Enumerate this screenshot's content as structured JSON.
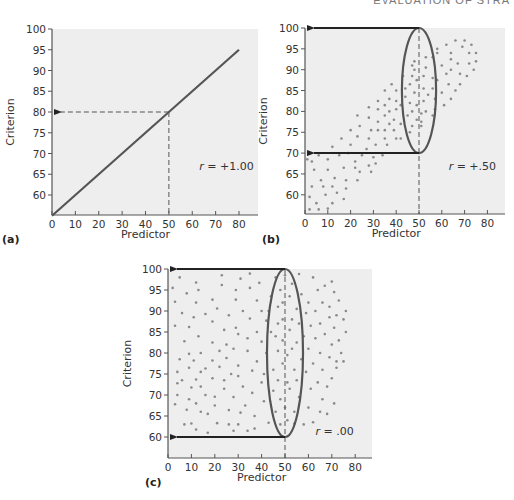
{
  "header": {
    "running_head": "EVALUATION OF STRA"
  },
  "colors": {
    "plot_bg": "#eeeeee",
    "axis": "#555555",
    "point": "#8a8a8a",
    "line": "#555555",
    "arrow": "#222222",
    "ellipse": "#555555"
  },
  "chart_data": [
    {
      "id": "a",
      "type": "line",
      "panel_label": "(a)",
      "title": "",
      "xlabel": "Predictor",
      "ylabel": "Criterion",
      "xlim": [
        0,
        88
      ],
      "ylim": [
        55,
        100
      ],
      "xticks": [
        0,
        10,
        20,
        30,
        40,
        50,
        60,
        70,
        80
      ],
      "yticks": [
        60,
        65,
        70,
        75,
        80,
        85,
        90,
        95,
        100
      ],
      "grid": false,
      "annotation": {
        "text": "r = +1.00",
        "r_symbol": "r",
        "r_value": " = +1.00",
        "x": 63,
        "y": 66
      },
      "series": [
        {
          "name": "perfect correlation",
          "x": [
            0,
            80
          ],
          "y": [
            55,
            95
          ]
        }
      ],
      "guide": {
        "x": 50,
        "y": 80,
        "style": "dashed",
        "arrow_to": "y-axis"
      }
    },
    {
      "id": "b",
      "type": "scatter",
      "panel_label": "(b)",
      "title": "",
      "xlabel": "Predictor",
      "ylabel": "Criterion",
      "xlim": [
        0,
        88
      ],
      "ylim": [
        55,
        100
      ],
      "xticks": [
        0,
        10,
        20,
        30,
        40,
        50,
        60,
        70,
        80
      ],
      "yticks": [
        60,
        65,
        70,
        75,
        80,
        85,
        90,
        95,
        100
      ],
      "grid": false,
      "annotation": {
        "text": "r = +.50",
        "r_symbol": "r",
        "r_value": " = +.50",
        "x": 63,
        "y": 66
      },
      "ellipse": {
        "cx": 50,
        "cy": 85,
        "rx": 7.5,
        "ry": 15
      },
      "arrows": [
        {
          "from_x": 50,
          "y": 100
        },
        {
          "from_x": 50,
          "y": 70
        }
      ],
      "guide": {
        "x": 50,
        "style": "dashed"
      },
      "points": [
        [
          1,
          68.5
        ],
        [
          3,
          68
        ],
        [
          6,
          69.5
        ],
        [
          2,
          59.5
        ],
        [
          3,
          62
        ],
        [
          4,
          66
        ],
        [
          5,
          58
        ],
        [
          7,
          63.5
        ],
        [
          8,
          62
        ],
        [
          2,
          56.5
        ],
        [
          6,
          56.5
        ],
        [
          10,
          56.7
        ],
        [
          9,
          60
        ],
        [
          10,
          66
        ],
        [
          10,
          68.5
        ],
        [
          12,
          62
        ],
        [
          12,
          58
        ],
        [
          13,
          64
        ],
        [
          14,
          60.5
        ],
        [
          12,
          71.5
        ],
        [
          15,
          69.5
        ],
        [
          17,
          59
        ],
        [
          18,
          63.5
        ],
        [
          18,
          61.5
        ],
        [
          17,
          66.5
        ],
        [
          19,
          70
        ],
        [
          20,
          72
        ],
        [
          20,
          75.5
        ],
        [
          16,
          73.5
        ],
        [
          22,
          66.5
        ],
        [
          23,
          63.5
        ],
        [
          22,
          68
        ],
        [
          24,
          65.5
        ],
        [
          25,
          69.5
        ],
        [
          23,
          74
        ],
        [
          24,
          76.5
        ],
        [
          23,
          79
        ],
        [
          27,
          71
        ],
        [
          28,
          67
        ],
        [
          28,
          73.5
        ],
        [
          29,
          65.5
        ],
        [
          29,
          75.5
        ],
        [
          28,
          78.5
        ],
        [
          28,
          81
        ],
        [
          30,
          69
        ],
        [
          31,
          72
        ],
        [
          31,
          67.5
        ],
        [
          32,
          75.5
        ],
        [
          32,
          77.5
        ],
        [
          32,
          80.5
        ],
        [
          32,
          82.5
        ],
        [
          34,
          69.5
        ],
        [
          35,
          73.5
        ],
        [
          35,
          75.5
        ],
        [
          35,
          79
        ],
        [
          35,
          81.5
        ],
        [
          35,
          85
        ],
        [
          36,
          72
        ],
        [
          37,
          77
        ],
        [
          37,
          83
        ],
        [
          37,
          80
        ],
        [
          39,
          75.5
        ],
        [
          39,
          78
        ],
        [
          40,
          73.5
        ],
        [
          40,
          82.5
        ],
        [
          40,
          85
        ],
        [
          40,
          80.5
        ],
        [
          38,
          86.5
        ],
        [
          42,
          73.5
        ],
        [
          42,
          77
        ],
        [
          42,
          81.5
        ],
        [
          43,
          88.5
        ],
        [
          44,
          83.5
        ],
        [
          44,
          85.5
        ],
        [
          45,
          79
        ],
        [
          46,
          75
        ],
        [
          46,
          86.5
        ],
        [
          46,
          82
        ],
        [
          47,
          88.5
        ],
        [
          47,
          91
        ],
        [
          47,
          80
        ],
        [
          47,
          76.5
        ],
        [
          48,
          84.5
        ],
        [
          48,
          92
        ],
        [
          48,
          90
        ],
        [
          49,
          78
        ],
        [
          49,
          81.5
        ],
        [
          49,
          87.5
        ],
        [
          51,
          76.5
        ],
        [
          51,
          77.5
        ],
        [
          51,
          79.5
        ],
        [
          52,
          82.5
        ],
        [
          52,
          85.5
        ],
        [
          52,
          88.5
        ],
        [
          53,
          90.5
        ],
        [
          53,
          80
        ],
        [
          53,
          93
        ],
        [
          54,
          84
        ],
        [
          56,
          79
        ],
        [
          56,
          85.5
        ],
        [
          56,
          88
        ],
        [
          56,
          93
        ],
        [
          57,
          80.5
        ],
        [
          57,
          83
        ],
        [
          58,
          94
        ],
        [
          58,
          95
        ],
        [
          58,
          87.5
        ],
        [
          60,
          91
        ],
        [
          60,
          84.5
        ],
        [
          61,
          81.5
        ],
        [
          62,
          96
        ],
        [
          62,
          89
        ],
        [
          63,
          86.5
        ],
        [
          64,
          92.5
        ],
        [
          64,
          83
        ],
        [
          64,
          90
        ],
        [
          64,
          94
        ],
        [
          66,
          97
        ],
        [
          66,
          85
        ],
        [
          67,
          91.5
        ],
        [
          68,
          86.5
        ],
        [
          68,
          89
        ],
        [
          69,
          95.5
        ],
        [
          70,
          97
        ],
        [
          71,
          88.5
        ],
        [
          72,
          91.5
        ],
        [
          72,
          94
        ],
        [
          73,
          96
        ],
        [
          74,
          90
        ],
        [
          75,
          92
        ],
        [
          75,
          94
        ]
      ]
    },
    {
      "id": "c",
      "type": "scatter",
      "panel_label": "(c)",
      "title": "",
      "xlabel": "Predictor",
      "ylabel": "Criterion",
      "xlim": [
        0,
        88
      ],
      "ylim": [
        55,
        100
      ],
      "xticks": [
        0,
        10,
        20,
        30,
        40,
        50,
        60,
        70,
        80
      ],
      "yticks": [
        60,
        65,
        70,
        75,
        80,
        85,
        90,
        95,
        100
      ],
      "grid": false,
      "annotation": {
        "text": "r = .00",
        "r_symbol": "r",
        "r_value": " = .00",
        "x": 63,
        "y": 60.5
      },
      "ellipse": {
        "cx": 50,
        "cy": 80,
        "rx": 7.7,
        "ry": 20
      },
      "arrows": [
        {
          "from_x": 50,
          "y": 100
        },
        {
          "from_x": 50,
          "y": 60
        }
      ],
      "guide": {
        "x": 50,
        "style": "dashed"
      },
      "points": [
        [
          2,
          95.5
        ],
        [
          3,
          92.2
        ],
        [
          3,
          86.5
        ],
        [
          5,
          98
        ],
        [
          6,
          89.5
        ],
        [
          7,
          82.8
        ],
        [
          8,
          94.2
        ],
        [
          9,
          86.2
        ],
        [
          9,
          79.8
        ],
        [
          9,
          76.5
        ],
        [
          5,
          78.5
        ],
        [
          4,
          75.5
        ],
        [
          4,
          72.8
        ],
        [
          4,
          70
        ],
        [
          3,
          67.8
        ],
        [
          6,
          73.5
        ],
        [
          8,
          66.5
        ],
        [
          7,
          63
        ],
        [
          9,
          69
        ],
        [
          10,
          71.8
        ],
        [
          10,
          63.2
        ],
        [
          12,
          61.8
        ],
        [
          12,
          68
        ],
        [
          12,
          73.7
        ],
        [
          11,
          78.2
        ],
        [
          11,
          88.5
        ],
        [
          12,
          92
        ],
        [
          12,
          96.8
        ],
        [
          13,
          95
        ],
        [
          13,
          84
        ],
        [
          14,
          80
        ],
        [
          14,
          75.5
        ],
        [
          14,
          72
        ],
        [
          14,
          66
        ],
        [
          16,
          89.3
        ],
        [
          16,
          76.3
        ],
        [
          16,
          70
        ],
        [
          17,
          61
        ],
        [
          17,
          65.5
        ],
        [
          19,
          92.7
        ],
        [
          19,
          87.5
        ],
        [
          19,
          82.5
        ],
        [
          19,
          78.2
        ],
        [
          19,
          74
        ],
        [
          20,
          69.6
        ],
        [
          20,
          67.5
        ],
        [
          21,
          63.3
        ],
        [
          21,
          90.6
        ],
        [
          22,
          80.5
        ],
        [
          22,
          76.7
        ],
        [
          23,
          96.2
        ],
        [
          23,
          98.5
        ],
        [
          24,
          71.5
        ],
        [
          24,
          73.5
        ],
        [
          24,
          85.5
        ],
        [
          25,
          82
        ],
        [
          25,
          78.8
        ],
        [
          26,
          66.4
        ],
        [
          26,
          89
        ],
        [
          26,
          63
        ],
        [
          27,
          75
        ],
        [
          28,
          69.5
        ],
        [
          28,
          61.5
        ],
        [
          28,
          81
        ],
        [
          29,
          86
        ],
        [
          29,
          92.7
        ],
        [
          29,
          95
        ],
        [
          30,
          77
        ],
        [
          30,
          74.5
        ],
        [
          30,
          84.5
        ],
        [
          30,
          63
        ],
        [
          31,
          65.8
        ],
        [
          31,
          97.7
        ],
        [
          32,
          90
        ],
        [
          32,
          72
        ],
        [
          33,
          67.5
        ],
        [
          34,
          61.5
        ],
        [
          34,
          80.5
        ],
        [
          34,
          83.5
        ],
        [
          35,
          88.2
        ],
        [
          35,
          95.5
        ],
        [
          35,
          98.9
        ],
        [
          36,
          75.8
        ],
        [
          36,
          70.5
        ],
        [
          37,
          65
        ],
        [
          37,
          62
        ],
        [
          38,
          92.5
        ],
        [
          38,
          85
        ],
        [
          38,
          78
        ],
        [
          39,
          96.7
        ],
        [
          40,
          90
        ],
        [
          40,
          82.7
        ],
        [
          40,
          73
        ],
        [
          41,
          68.5
        ],
        [
          41,
          75
        ],
        [
          42,
          87.7
        ],
        [
          42,
          80
        ],
        [
          43,
          63.4
        ],
        [
          43,
          90
        ],
        [
          44,
          85
        ],
        [
          44,
          93.5
        ],
        [
          45,
          71
        ],
        [
          45,
          76
        ],
        [
          46,
          84
        ],
        [
          46,
          66
        ],
        [
          46,
          98
        ],
        [
          47,
          87
        ],
        [
          47,
          80.5
        ],
        [
          47,
          91
        ],
        [
          47,
          73.5
        ],
        [
          48,
          95
        ],
        [
          48,
          69
        ],
        [
          48,
          63
        ],
        [
          49,
          77.5
        ],
        [
          49,
          83
        ],
        [
          49,
          88
        ],
        [
          49,
          92
        ],
        [
          50,
          67
        ],
        [
          50,
          98.5
        ],
        [
          51,
          79.5
        ],
        [
          51,
          73
        ],
        [
          51,
          64
        ],
        [
          52,
          85.5
        ],
        [
          52,
          93.5
        ],
        [
          52,
          71.5
        ],
        [
          53,
          88
        ],
        [
          53,
          96.5
        ],
        [
          53,
          81
        ],
        [
          54,
          66
        ],
        [
          54,
          76
        ],
        [
          54,
          63.2
        ],
        [
          55,
          90.5
        ],
        [
          55,
          82.5
        ],
        [
          55,
          73.5
        ],
        [
          56,
          87
        ],
        [
          56,
          98.8
        ],
        [
          56,
          69.5
        ],
        [
          57,
          78.5
        ],
        [
          57,
          94
        ],
        [
          58,
          84
        ],
        [
          58,
          63
        ],
        [
          59,
          89.5
        ],
        [
          59,
          75.5
        ],
        [
          60,
          92
        ],
        [
          60,
          67
        ],
        [
          60,
          81
        ],
        [
          61,
          86.5
        ],
        [
          61,
          71.5
        ],
        [
          62,
          98
        ],
        [
          62,
          77.5
        ],
        [
          62,
          63.5
        ],
        [
          63,
          90
        ],
        [
          63,
          83.5
        ],
        [
          64,
          95
        ],
        [
          64,
          73
        ],
        [
          65,
          87
        ],
        [
          65,
          66
        ],
        [
          65,
          80
        ],
        [
          66,
          92
        ],
        [
          66,
          76
        ],
        [
          66,
          69
        ],
        [
          67,
          96
        ],
        [
          67,
          84.5
        ],
        [
          68,
          72
        ],
        [
          68,
          65.5
        ],
        [
          69,
          88.5
        ],
        [
          69,
          79
        ],
        [
          69,
          91
        ],
        [
          70,
          97
        ],
        [
          70,
          82
        ],
        [
          70,
          74
        ],
        [
          71,
          94.5
        ],
        [
          71,
          86
        ],
        [
          71,
          68
        ],
        [
          72,
          89
        ],
        [
          72,
          78
        ],
        [
          72,
          76.5
        ],
        [
          73,
          83
        ],
        [
          73,
          92.5
        ],
        [
          74,
          80
        ],
        [
          75,
          88
        ],
        [
          75,
          78
        ],
        [
          76,
          85
        ],
        [
          76,
          90
        ]
      ]
    }
  ]
}
